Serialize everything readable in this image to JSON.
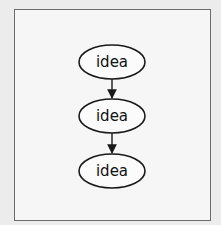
{
  "diagram": {
    "type": "flowchart",
    "nodes": [
      {
        "id": "n1",
        "label": "idea",
        "shape": "ellipse"
      },
      {
        "id": "n2",
        "label": "idea",
        "shape": "ellipse"
      },
      {
        "id": "n3",
        "label": "idea",
        "shape": "ellipse"
      }
    ],
    "edges": [
      {
        "from": "n1",
        "to": "n2",
        "directed": true
      },
      {
        "from": "n2",
        "to": "n3",
        "directed": true
      }
    ],
    "colors": {
      "stroke": "#1a1a1a",
      "frame": "#6b6b6b",
      "background": "#ececec"
    }
  }
}
